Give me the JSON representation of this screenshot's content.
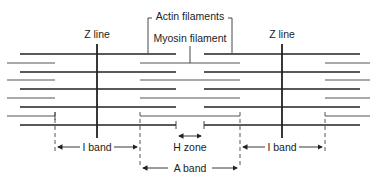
{
  "labels": {
    "z_line_left": "Z line",
    "z_line_right": "Z line",
    "actin": "Actin filaments",
    "myosin": "Myosin filament",
    "i_band_left": "I band",
    "i_band_right": "I band",
    "h_zone": "H zone",
    "a_band": "A band"
  },
  "colors": {
    "line": "#222222",
    "thin": "#555555",
    "background": "#ffffff"
  }
}
